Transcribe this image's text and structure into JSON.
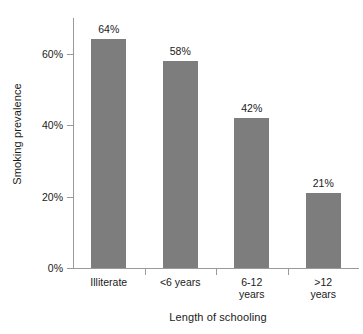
{
  "chart_data": {
    "type": "bar",
    "title": "",
    "xlabel": "Length of schooling",
    "ylabel": "Smoking prevalence",
    "categories": [
      "Illiterate",
      "<6 years",
      "6-12\nyears",
      ">12\nyears"
    ],
    "values": [
      64,
      58,
      42,
      21
    ],
    "value_labels": [
      "64%",
      "58%",
      "42%",
      "21%"
    ],
    "ylim": [
      0,
      70
    ],
    "yticks": [
      0,
      20,
      40,
      60
    ],
    "ytick_labels": [
      "0%",
      "20%",
      "40%",
      "60%"
    ],
    "grid": false,
    "legend": "none",
    "bar_color": "#7d7d7d",
    "axis_color": "#9a9a9a",
    "background_color": "#ffffff",
    "text_color": "#1a1a1a"
  },
  "axis": {
    "y_title": "Smoking prevalence",
    "x_title": "Length of schooling"
  },
  "ticks": {
    "y": [
      {
        "label": "0%",
        "value": 0
      },
      {
        "label": "20%",
        "value": 20
      },
      {
        "label": "40%",
        "value": 40
      },
      {
        "label": "60%",
        "value": 60
      }
    ]
  },
  "bars": [
    {
      "category": "Illiterate",
      "value": 64,
      "label": "64%"
    },
    {
      "category": "<6 years",
      "value": 58,
      "label": "58%"
    },
    {
      "category": "6-12\nyears",
      "value": 42,
      "label": "42%"
    },
    {
      "category": ">12\nyears",
      "value": 21,
      "label": "21%"
    }
  ]
}
